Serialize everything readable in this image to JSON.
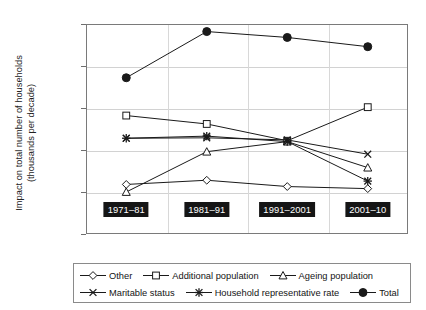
{
  "chart_data": {
    "type": "line",
    "title": "",
    "xlabel": "",
    "ylabel": "Impact on total number of households (thousands per decade)",
    "ylabel_line1": "Impact on total number of households",
    "ylabel_line2": "(thousands per decade)",
    "categories": [
      "1971–81",
      "1981–91",
      "1991–2001",
      "2001–10"
    ],
    "ylim": [
      -500,
      2000
    ],
    "yticks": [
      2000,
      1500,
      1000,
      500,
      0,
      -500
    ],
    "ytick_labels": [
      "2,000",
      "1,500",
      "1,000",
      "500",
      "0",
      "−500"
    ],
    "grid": true,
    "legend_position": "bottom",
    "series": [
      {
        "name": "Other",
        "marker": "diamond",
        "filled": false,
        "values": [
          90,
          140,
          65,
          40
        ]
      },
      {
        "name": "Additional population",
        "marker": "square",
        "filled": false,
        "values": [
          910,
          810,
          610,
          1010
        ]
      },
      {
        "name": "Ageing population",
        "marker": "triangle",
        "filled": false,
        "values": [
          0,
          480,
          600,
          290
        ]
      },
      {
        "name": "Maritable status",
        "marker": "cross",
        "filled": true,
        "values": [
          640,
          645,
          620,
          450
        ]
      },
      {
        "name": "Household representative rate",
        "marker": "star",
        "filled": true,
        "values": [
          640,
          665,
          600,
          130
        ]
      },
      {
        "name": "Total",
        "marker": "circle",
        "filled": true,
        "values": [
          1360,
          1910,
          1840,
          1730
        ]
      }
    ]
  },
  "colors": {
    "line": "#1a1a1a",
    "frame": "#7a7a7a",
    "grid": "#d2d2d2",
    "category_box_bg": "#151515",
    "category_box_text": "#ffffff"
  }
}
